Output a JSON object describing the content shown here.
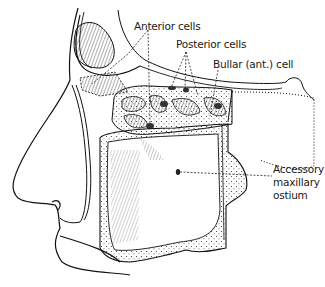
{
  "figure": {
    "type": "anatomical-illustration",
    "labels": {
      "anterior_cells": "Anterior cells",
      "posterior_cells": "Posterior cells",
      "bullar_cell": "Bullar (ant.) cell",
      "accessory_line1": "Accessory",
      "accessory_line2": "maxillary",
      "accessory_line3": "ostium"
    }
  }
}
